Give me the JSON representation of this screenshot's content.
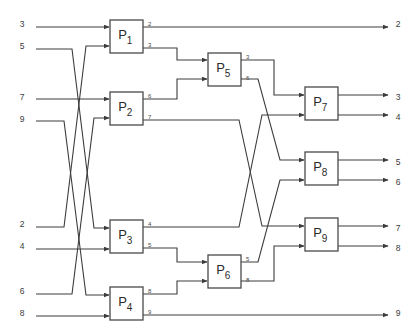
{
  "diagram": {
    "type": "block-flow-network",
    "colors": {
      "background": "#ffffff",
      "wire": "#3c3c3c",
      "box_stroke": "#4a4a4a",
      "box_fill": "#ffffff",
      "text": "#2b2b2b",
      "small_text": "#4a4a4a"
    },
    "geometry": {
      "width": 415,
      "height": 334,
      "box_w": 33,
      "box_h": 33,
      "arrow_size": 4
    },
    "inputs": [
      {
        "name": "input-3",
        "label": "3",
        "x": 22,
        "y": 22,
        "wire_x": 36,
        "target": "P1.in1",
        "route": "straight"
      },
      {
        "name": "input-5",
        "label": "5",
        "x": 22,
        "y": 44,
        "wire_x": 36,
        "target": "P3.in1",
        "route": "cross-down"
      },
      {
        "name": "input-7",
        "label": "7",
        "x": 22,
        "y": 95,
        "wire_x": 36,
        "target": "P2.in1",
        "route": "straight"
      },
      {
        "name": "input-9",
        "label": "9",
        "x": 22,
        "y": 117,
        "wire_x": 36,
        "target": "P4.in1",
        "route": "cross-down"
      },
      {
        "name": "input-2",
        "label": "2",
        "x": 22,
        "y": 222,
        "wire_x": 36,
        "target": "P1.in2",
        "route": "cross-up"
      },
      {
        "name": "input-4",
        "label": "4",
        "x": 22,
        "y": 244,
        "wire_x": 36,
        "target": "P3.in2",
        "route": "straight"
      },
      {
        "name": "input-6",
        "label": "6",
        "x": 22,
        "y": 289,
        "wire_x": 36,
        "target": "P2.in2",
        "route": "cross-up"
      },
      {
        "name": "input-8",
        "label": "8",
        "x": 22,
        "y": 311,
        "wire_x": 36,
        "target": "P4.in2",
        "route": "straight"
      }
    ],
    "nodes": [
      {
        "name": "node-p1",
        "label": "P",
        "sub": "1",
        "x": 110,
        "y": 20,
        "stage": 1
      },
      {
        "name": "node-p2",
        "label": "P",
        "sub": "2",
        "x": 110,
        "y": 92,
        "stage": 1
      },
      {
        "name": "node-p3",
        "label": "P",
        "sub": "3",
        "x": 110,
        "y": 220,
        "stage": 1
      },
      {
        "name": "node-p4",
        "label": "P",
        "sub": "4",
        "x": 110,
        "y": 287,
        "stage": 1
      },
      {
        "name": "node-p5",
        "label": "P",
        "sub": "5",
        "x": 208,
        "y": 53,
        "stage": 2
      },
      {
        "name": "node-p6",
        "label": "P",
        "sub": "6",
        "x": 208,
        "y": 255,
        "stage": 2
      },
      {
        "name": "node-p7",
        "label": "P",
        "sub": "7",
        "x": 305,
        "y": 87,
        "stage": 3
      },
      {
        "name": "node-p8",
        "label": "P",
        "sub": "8",
        "x": 305,
        "y": 152,
        "stage": 3
      },
      {
        "name": "node-p9",
        "label": "P",
        "sub": "9",
        "x": 305,
        "y": 218,
        "stage": 3
      }
    ],
    "port_labels": [
      {
        "name": "port-label-p1-out1",
        "label": "2",
        "x": 148,
        "y": 26,
        "from": "P1",
        "port": "out1"
      },
      {
        "name": "port-label-p1-out2",
        "label": "3",
        "x": 148,
        "y": 47,
        "from": "P1",
        "port": "out2"
      },
      {
        "name": "port-label-p2-out1",
        "label": "6",
        "x": 148,
        "y": 98,
        "from": "P2",
        "port": "out1"
      },
      {
        "name": "port-label-p2-out2",
        "label": "7",
        "x": 148,
        "y": 119,
        "from": "P2",
        "port": "out2"
      },
      {
        "name": "port-label-p5-out1",
        "label": "3",
        "x": 246,
        "y": 59,
        "from": "P5",
        "port": "out1"
      },
      {
        "name": "port-label-p5-out2",
        "label": "6",
        "x": 246,
        "y": 80,
        "from": "P5",
        "port": "out2"
      },
      {
        "name": "port-label-p3-out1",
        "label": "4",
        "x": 148,
        "y": 226,
        "from": "P3",
        "port": "out1"
      },
      {
        "name": "port-label-p3-out2",
        "label": "5",
        "x": 148,
        "y": 247,
        "from": "P3",
        "port": "out2"
      },
      {
        "name": "port-label-p4-out1",
        "label": "8",
        "x": 148,
        "y": 293,
        "from": "P4",
        "port": "out1"
      },
      {
        "name": "port-label-p4-out2",
        "label": "9",
        "x": 148,
        "y": 314,
        "from": "P4",
        "port": "out2"
      },
      {
        "name": "port-label-p6-out1",
        "label": "5",
        "x": 246,
        "y": 261,
        "from": "P6",
        "port": "out1"
      },
      {
        "name": "port-label-p6-out2",
        "label": "8",
        "x": 246,
        "y": 282,
        "from": "P6",
        "port": "out2"
      }
    ],
    "outputs": [
      {
        "name": "output-2",
        "label": "2",
        "x": 398,
        "y": 22,
        "arrow_x": 388,
        "source": "P1.out1"
      },
      {
        "name": "output-3",
        "label": "3",
        "x": 398,
        "y": 95,
        "arrow_x": 388,
        "source": "P7.out1"
      },
      {
        "name": "output-4",
        "label": "4",
        "x": 398,
        "y": 115,
        "arrow_x": 388,
        "source": "P7.out2"
      },
      {
        "name": "output-5",
        "label": "5",
        "x": 398,
        "y": 160,
        "arrow_x": 388,
        "source": "P8.out1"
      },
      {
        "name": "output-6",
        "label": "6",
        "x": 398,
        "y": 180,
        "arrow_x": 388,
        "source": "P8.out2"
      },
      {
        "name": "output-7",
        "label": "7",
        "x": 398,
        "y": 226,
        "arrow_x": 388,
        "source": "P9.out1"
      },
      {
        "name": "output-8",
        "label": "8",
        "x": 398,
        "y": 246,
        "arrow_x": 388,
        "source": "P9.out2"
      },
      {
        "name": "output-9",
        "label": "9",
        "x": 398,
        "y": 311,
        "arrow_x": 388,
        "source": "P4.out2"
      }
    ],
    "connections": [
      {
        "name": "wire-in3-p1",
        "from": "input-3",
        "to": "P1.in1",
        "path": "M36,27 L109,27"
      },
      {
        "name": "wire-in5-p3",
        "from": "input-5",
        "to": "P3.in1",
        "path": "M36,49 L72,49 L94,228 L109,228"
      },
      {
        "name": "wire-in2-p1",
        "from": "input-2",
        "to": "P1.in2",
        "path": "M36,227 L64,227 L86,46 L109,46"
      },
      {
        "name": "wire-in7-p2",
        "from": "input-7",
        "to": "P2.in1",
        "path": "M36,99 L109,99"
      },
      {
        "name": "wire-in9-p4",
        "from": "input-9",
        "to": "P4.in1",
        "path": "M36,121 L64,121 L86,295 L109,295"
      },
      {
        "name": "wire-in6-p2",
        "from": "input-6",
        "to": "P2.in2",
        "path": "M36,294 L72,294 L94,118 L109,118"
      },
      {
        "name": "wire-in4-p3",
        "from": "input-4",
        "to": "P3.in2",
        "path": "M36,249 L109,249"
      },
      {
        "name": "wire-in8-p4",
        "from": "input-8",
        "to": "P4.in2",
        "path": "M36,316 L109,316"
      },
      {
        "name": "wire-p1out1-out2",
        "from": "P1.out1",
        "to": "output-2",
        "path": "M143,27 L388,27"
      },
      {
        "name": "wire-p1out2-p5",
        "from": "P1.out2",
        "to": "P5.in1",
        "path": "M143,48 L177,48 L177,60 L207,60"
      },
      {
        "name": "wire-p2out1-p5",
        "from": "P2.out1",
        "to": "P5.in2",
        "path": "M143,99 L177,99 L177,79 L207,79"
      },
      {
        "name": "wire-p2out2-p9",
        "from": "P2.out2",
        "to": "P9.in1",
        "path": "M143,120 L239,120 L262,226 L304,226"
      },
      {
        "name": "wire-p5out1-p7",
        "from": "P5.out1",
        "to": "P7.in1",
        "path": "M241,60 L274,60 L274,95 L304,95"
      },
      {
        "name": "wire-p5out2-p8",
        "from": "P5.out2",
        "to": "P8.in1",
        "path": "M241,79 L258,79 L280,160 L304,160"
      },
      {
        "name": "wire-p3out1-p7",
        "from": "P3.out1",
        "to": "P7.in2",
        "path": "M143,227 L239,227 L262,115 L304,115"
      },
      {
        "name": "wire-p3out2-p6",
        "from": "P3.out2",
        "to": "P6.in1",
        "path": "M143,248 L177,248 L177,262 L207,262"
      },
      {
        "name": "wire-p4out1-p6",
        "from": "P4.out1",
        "to": "P6.in2",
        "path": "M143,294 L177,294 L177,281 L207,281"
      },
      {
        "name": "wire-p4out2-out9",
        "from": "P4.out2",
        "to": "output-9",
        "path": "M143,315 L388,315"
      },
      {
        "name": "wire-p6out1-p8",
        "from": "P6.out1",
        "to": "P8.in2",
        "path": "M241,262 L258,262 L280,180 L304,180"
      },
      {
        "name": "wire-p6out2-p9",
        "from": "P6.out2",
        "to": "P9.in2",
        "path": "M241,281 L274,281 L274,246 L304,246"
      },
      {
        "name": "wire-p7out1-out3",
        "from": "P7.out1",
        "to": "output-3",
        "path": "M338,95 L388,95"
      },
      {
        "name": "wire-p7out2-out4",
        "from": "P7.out2",
        "to": "output-4",
        "path": "M338,115 L388,115"
      },
      {
        "name": "wire-p8out1-out5",
        "from": "P8.out1",
        "to": "output-5",
        "path": "M338,160 L388,160"
      },
      {
        "name": "wire-p8out2-out6",
        "from": "P8.out2",
        "to": "output-6",
        "path": "M338,180 L388,180"
      },
      {
        "name": "wire-p9out1-out7",
        "from": "P9.out1",
        "to": "output-7",
        "path": "M338,226 L388,226"
      },
      {
        "name": "wire-p9out2-out8",
        "from": "P9.out2",
        "to": "output-8",
        "path": "M338,246 L388,246"
      }
    ]
  }
}
